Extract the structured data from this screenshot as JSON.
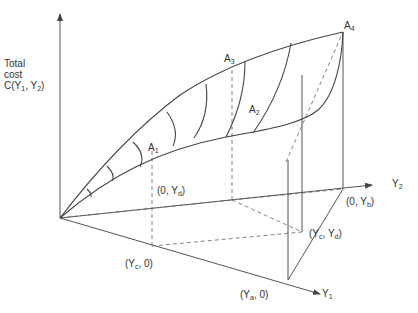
{
  "diagram": {
    "axis_label": {
      "line1": "Total",
      "line2": "cost",
      "line3_pre": "C(Y",
      "sub1": "1",
      "mid": ", Y",
      "sub2": "2",
      "post": ")"
    },
    "axes": {
      "y1": {
        "pre": "Y",
        "sub": "1"
      },
      "y2": {
        "pre": "Y",
        "sub": "2"
      }
    },
    "points": {
      "A1": {
        "pre": "A",
        "sub": "1"
      },
      "A2": {
        "pre": "A",
        "sub": "2"
      },
      "A3": {
        "pre": "A",
        "sub": "3"
      },
      "A4": {
        "pre": "A",
        "sub": "4"
      }
    },
    "coords": {
      "zero_yd": {
        "pre": "(0, Y",
        "sub": "d",
        "post": ")"
      },
      "zero_yb": {
        "pre": "(0, Y",
        "sub": "b",
        "post": ")"
      },
      "yc_yd": {
        "pre": "(Y",
        "sub": "c",
        "mid": ", Y",
        "sub2": "d",
        "post": ")"
      },
      "yc_zero": {
        "pre": "(Y",
        "sub": "c",
        "post": ", 0)"
      },
      "ya_zero": {
        "pre": "(Y",
        "sub": "a",
        "post": ", 0)"
      }
    }
  }
}
